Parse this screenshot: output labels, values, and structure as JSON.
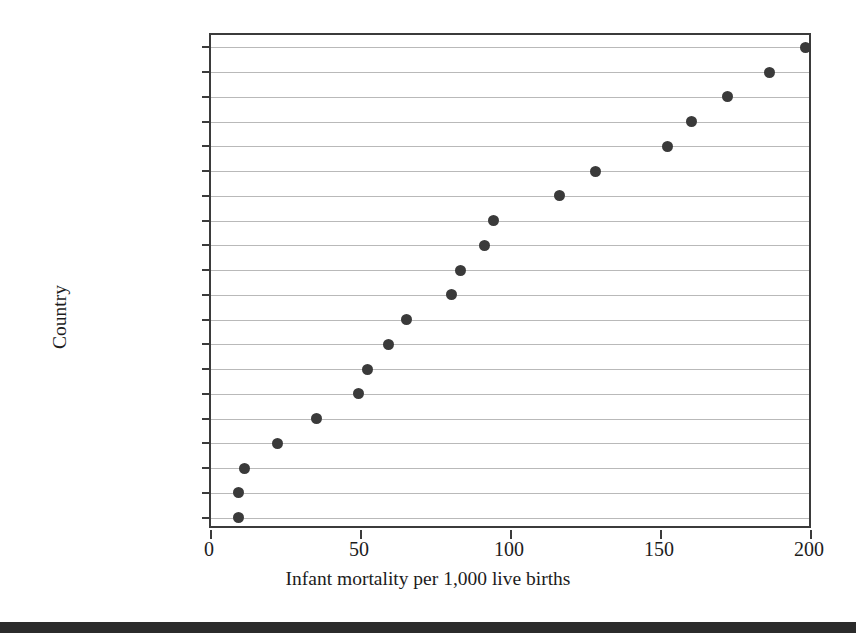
{
  "chart_data": {
    "type": "scatter",
    "title": "",
    "xlabel": "Infant mortality per 1,000 live births",
    "ylabel": "Country",
    "xlim": [
      0,
      200
    ],
    "xticks": [
      0,
      50,
      100,
      150,
      200
    ],
    "xticklabels": [
      "0",
      "50",
      "100",
      "150",
      "200"
    ],
    "grid": "horizontal",
    "legend": "none",
    "orientation": "horizontal-dot-plot",
    "categories": [
      "Rwanda",
      "Yemen",
      "Sudan",
      "Bolivia",
      "Laos",
      "Lesotho",
      "Peru",
      "Guatemala",
      "Saudi Arabia",
      "Brazil",
      "Turkey",
      "Vietnam",
      "Syria",
      "Jordan",
      "Oman",
      "Argentina",
      "Costa Rica",
      "Israel",
      "Belgium",
      "Canada"
    ],
    "values": [
      198,
      186,
      172,
      160,
      152,
      128,
      116,
      94,
      91,
      83,
      80,
      65,
      59,
      52,
      49,
      35,
      22,
      11,
      9,
      9
    ],
    "colors": {
      "marker": "#3a3a3a",
      "gridline": "#b9b9b9",
      "axis": "#3b3b3b",
      "text": "#1c1c1c",
      "background": "#ffffff",
      "footer_rule": "#2b2b2b"
    }
  }
}
